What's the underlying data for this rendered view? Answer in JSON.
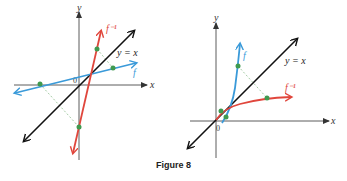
{
  "caption": "Figure 8",
  "colors": {
    "axis": "#333333",
    "identity_line": "#111111",
    "f": "#3a9ad9",
    "f_inverse": "#e0463c",
    "point": "#3f9a4f",
    "dashed": "#8fbf8f"
  },
  "left_graph": {
    "x_label": "x",
    "y_label": "y",
    "origin_label": "0",
    "identity_label": "y = x",
    "f_label": "f",
    "f_inverse_label": "f⁻¹"
  },
  "right_graph": {
    "x_label": "x",
    "y_label": "y",
    "origin_label": "0",
    "identity_label": "y = x",
    "f_label": "f",
    "f_inverse_label": "f⁻¹"
  }
}
